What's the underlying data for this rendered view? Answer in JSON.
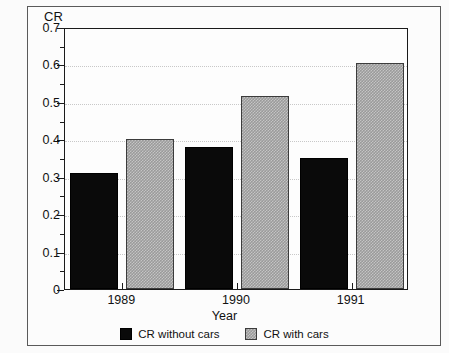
{
  "chart_data": {
    "type": "bar",
    "title": "",
    "ylabel": "CR",
    "xlabel": "Year",
    "categories": [
      "1989",
      "1990",
      "1991"
    ],
    "series": [
      {
        "name": "CR without cars",
        "color": "#0a0a0a",
        "values": [
          0.31,
          0.38,
          0.35
        ]
      },
      {
        "name": "CR with cars",
        "color": "#9a9a9a",
        "values": [
          0.4,
          0.515,
          0.605
        ]
      }
    ],
    "ylim": [
      0,
      0.7
    ],
    "ytick_labels": [
      "0",
      "0.1",
      "0.2",
      "0.3",
      "0.4",
      "0.5",
      "0.6",
      "0.7"
    ],
    "ytick_values": [
      0,
      0.1,
      0.2,
      0.3,
      0.4,
      0.5,
      0.6,
      0.7
    ],
    "yminor_values": [
      0.05,
      0.15,
      0.25,
      0.35,
      0.45,
      0.55,
      0.65
    ],
    "grid": true,
    "grid_axis": "y",
    "legend_position": "bottom"
  },
  "legend": {
    "entries": [
      {
        "label": "CR without cars"
      },
      {
        "label": "CR with cars"
      }
    ]
  }
}
